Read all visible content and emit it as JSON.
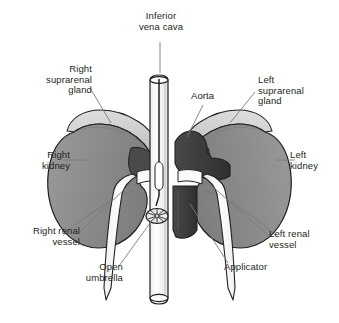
{
  "figure": {
    "type": "medical-anatomical-illustration",
    "background_color": "#ffffff",
    "line_color": "#231f20"
  },
  "palette": {
    "kidney_gray": "#8f8f8f",
    "kidney_gray_light": "#a8a8a8",
    "suprarenal_light": "#d6d6d6",
    "aorta_dark": "#3a3a3a",
    "hilum_dark": "#4a4a4a",
    "vessel_white": "#fdfdfd",
    "outline": "#231f20",
    "leader_line": "#6e6e6e",
    "text": "#231f20"
  },
  "labels": {
    "inferior_vena_cava": "Inferior\nvena cava",
    "right_suprarenal_gland": "Right\nsuprarenal\ngland",
    "left_suprarenal_gland": "Left\nsuprarenal\ngland",
    "aorta": "Aorta",
    "right_kidney": "Right\nkidney",
    "left_kidney": "Left\nkidney",
    "right_renal_vessel": "Right renal\nvessel",
    "left_renal_vessel": "Left renal\nvessel",
    "open_umbrella": "Open\numbrella",
    "applicator": "Applicator"
  },
  "structures": [
    {
      "name": "inferior-vena-cava",
      "description": "vertical white tube, open ellipse at top and bottom, runs down center of figure"
    },
    {
      "name": "aorta",
      "description": "dark charcoal vessel to the right of the vena cava"
    },
    {
      "name": "right-kidney",
      "description": "medium gray bean-shaped organ on the viewer's left"
    },
    {
      "name": "left-kidney",
      "description": "medium gray bean-shaped organ on the viewer's right"
    },
    {
      "name": "right-suprarenal-gland",
      "description": "light gray cap atop the right kidney"
    },
    {
      "name": "left-suprarenal-gland",
      "description": "light gray cap atop the left kidney"
    },
    {
      "name": "right-renal-vessel",
      "description": "white tapering tube descending from right kidney hilum"
    },
    {
      "name": "left-renal-vessel",
      "description": "white tapering tube descending from left kidney hilum"
    },
    {
      "name": "open-umbrella",
      "description": "small circular filter device with radiating spokes inside the vena cava"
    },
    {
      "name": "applicator",
      "description": "thin catheter line running down inside the vena cava to the umbrella"
    }
  ]
}
